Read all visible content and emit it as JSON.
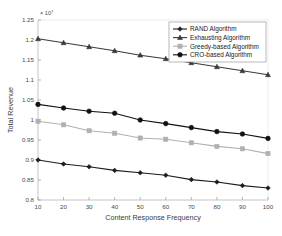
{
  "chart_data": {
    "type": "line",
    "title": "",
    "xlabel": "Content Response Frequency",
    "ylabel": "Total Revenue",
    "y_multiplier_label": "10",
    "y_multiplier_exponent": "7",
    "x": [
      10,
      20,
      30,
      40,
      50,
      60,
      70,
      80,
      90,
      100
    ],
    "xlim": [
      10,
      100
    ],
    "ylim": [
      0.8,
      1.25
    ],
    "xticks": [
      "10",
      "20",
      "30",
      "40",
      "50",
      "60",
      "70",
      "80",
      "90",
      "100"
    ],
    "yticks": [
      "0.8",
      "0.85",
      "0.9",
      "0.95",
      "1",
      "1.05",
      "1.1",
      "1.15",
      "1.2",
      "1.25"
    ],
    "grid": false,
    "legend_position": "top-right",
    "series": [
      {
        "name": "RAND Algorithm",
        "marker": "diamond",
        "color": "#1c1c1c",
        "values": [
          0.9,
          0.89,
          0.883,
          0.874,
          0.868,
          0.862,
          0.851,
          0.845,
          0.836,
          0.83
        ]
      },
      {
        "name": "Exhausting Algorithm",
        "marker": "triangle",
        "color": "#3a3a3a",
        "values": [
          1.203,
          1.193,
          1.183,
          1.173,
          1.162,
          1.153,
          1.143,
          1.133,
          1.123,
          1.113
        ]
      },
      {
        "name": "Greedy-based Algorithm",
        "marker": "square",
        "color": "#b0b0b0",
        "values": [
          0.997,
          0.988,
          0.973,
          0.967,
          0.955,
          0.952,
          0.943,
          0.934,
          0.928,
          0.916
        ]
      },
      {
        "name": "CRO-based Algorithm",
        "marker": "circle",
        "color": "#111111",
        "values": [
          1.039,
          1.03,
          1.022,
          1.017,
          1.0,
          0.991,
          0.981,
          0.971,
          0.965,
          0.954
        ]
      }
    ]
  },
  "figure": {
    "background": "#ffffff",
    "axis_color": "#b8b8b8"
  }
}
